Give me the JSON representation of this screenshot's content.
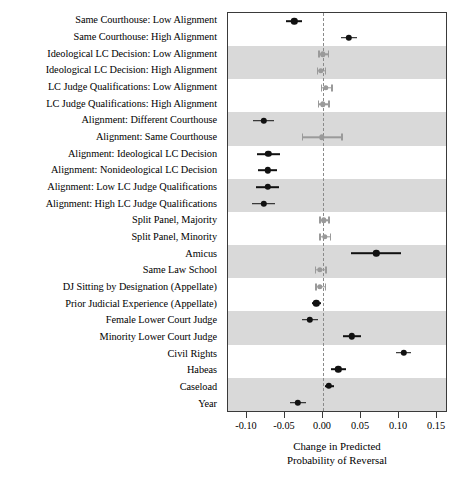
{
  "chart_data": {
    "type": "scatter",
    "title": "",
    "subtitle": "",
    "xlabel_line1": "Change in Predicted",
    "xlabel_line2": "Probability of Reversal",
    "ylabel": "",
    "xlim": [
      -0.125,
      0.1644
    ],
    "xticks": [
      -0.1,
      -0.05,
      0.0,
      0.05,
      0.1,
      0.15
    ],
    "xticklabels": [
      "-0.10",
      "-0.05",
      "0.00",
      "0.05",
      "0.10",
      "0.15"
    ],
    "grid": false,
    "legend": false,
    "zero_reference_line": 0.0,
    "orientation": "horizontal",
    "marker": "circle-with-confidence-interval",
    "colors": {
      "significant": "#111111",
      "not_significant": "#9a9a9a",
      "band_shading": "#d9d9d9",
      "frame": "#3a3a3a",
      "zero_line": "#8a8a8a",
      "background": "#ffffff"
    },
    "categories": [
      "Same Courthouse: Low Alignment",
      "Same Courthouse: High Alignment",
      "Ideological LC Decision: Low Alignment",
      "Ideological LC Decision: High Alignment",
      "LC Judge Qualifications: Low Alignment",
      "LC Judge Qualifications: High Alignment",
      "Alignment: Different Courthouse",
      "Alignment: Same Courthouse",
      "Alignment: Ideological LC Decision",
      "Alignment: Nonideological LC Decision",
      "Alignment: Low LC Judge Qualifications",
      "Alignment: High LC Judge Qualifications",
      "Split Panel, Majority",
      "Split Panel, Minority",
      "Amicus",
      "Same Law School",
      "DJ Sitting by Designation (Appellate)",
      "Prior Judicial Experience (Appellate)",
      "Female Lower Court Judge",
      "Minority Lower Court Judge",
      "Civil Rights",
      "Habeas",
      "Caseload",
      "Year"
    ],
    "points": [
      {
        "label": "Same Courthouse: Low Alignment",
        "estimate": -0.038,
        "ci_low": -0.049,
        "ci_high": -0.027,
        "significant": true
      },
      {
        "label": "Same Courthouse: High Alignment",
        "estimate": 0.034,
        "ci_low": 0.023,
        "ci_high": 0.045,
        "significant": true
      },
      {
        "label": "Ideological LC Decision: Low Alignment",
        "estimate": 0.0,
        "ci_low": -0.006,
        "ci_high": 0.006,
        "significant": false
      },
      {
        "label": "Ideological LC Decision: High Alignment",
        "estimate": -0.003,
        "ci_low": -0.008,
        "ci_high": 0.002,
        "significant": false
      },
      {
        "label": "LC Judge Qualifications: Low Alignment",
        "estimate": 0.004,
        "ci_low": -0.003,
        "ci_high": 0.011,
        "significant": false
      },
      {
        "label": "LC Judge Qualifications: High Alignment",
        "estimate": 0.0,
        "ci_low": -0.007,
        "ci_high": 0.007,
        "significant": false
      },
      {
        "label": "Alignment: Different Courthouse",
        "estimate": -0.078,
        "ci_low": -0.092,
        "ci_high": -0.064,
        "significant": true
      },
      {
        "label": "Alignment: Same Courthouse",
        "estimate": -0.002,
        "ci_low": -0.028,
        "ci_high": 0.024,
        "significant": false
      },
      {
        "label": "Alignment: Ideological LC Decision",
        "estimate": -0.072,
        "ci_low": -0.087,
        "ci_high": -0.057,
        "significant": true
      },
      {
        "label": "Alignment: Nonideological LC Decision",
        "estimate": -0.073,
        "ci_low": -0.086,
        "ci_high": -0.06,
        "significant": true
      },
      {
        "label": "Alignment: Low LC Judge Qualifications",
        "estimate": -0.073,
        "ci_low": -0.088,
        "ci_high": -0.058,
        "significant": true
      },
      {
        "label": "Alignment: High LC Judge Qualifications",
        "estimate": -0.078,
        "ci_low": -0.093,
        "ci_high": -0.063,
        "significant": true
      },
      {
        "label": "Split Panel, Majority",
        "estimate": 0.001,
        "ci_low": -0.005,
        "ci_high": 0.007,
        "significant": false
      },
      {
        "label": "Split Panel, Minority",
        "estimate": 0.002,
        "ci_low": -0.005,
        "ci_high": 0.009,
        "significant": false
      },
      {
        "label": "Amicus",
        "estimate": 0.07,
        "ci_low": 0.037,
        "ci_high": 0.102,
        "significant": true
      },
      {
        "label": "Same Law School",
        "estimate": -0.004,
        "ci_low": -0.011,
        "ci_high": 0.003,
        "significant": false
      },
      {
        "label": "DJ Sitting by Designation (Appellate)",
        "estimate": -0.004,
        "ci_low": -0.01,
        "ci_high": 0.002,
        "significant": false
      },
      {
        "label": "Prior Judicial Experience (Appellate)",
        "estimate": -0.009,
        "ci_low": -0.015,
        "ci_high": -0.003,
        "significant": true
      },
      {
        "label": "Female Lower Court Judge",
        "estimate": -0.017,
        "ci_low": -0.027,
        "ci_high": -0.007,
        "significant": true
      },
      {
        "label": "Minority Lower Court Judge",
        "estimate": 0.038,
        "ci_low": 0.026,
        "ci_high": 0.05,
        "significant": true
      },
      {
        "label": "Civil Rights",
        "estimate": 0.106,
        "ci_low": 0.096,
        "ci_high": 0.116,
        "significant": true
      },
      {
        "label": "Habeas",
        "estimate": 0.02,
        "ci_low": 0.01,
        "ci_high": 0.03,
        "significant": true
      },
      {
        "label": "Caseload",
        "estimate": 0.008,
        "ci_low": 0.002,
        "ci_high": 0.014,
        "significant": true
      },
      {
        "label": "Year",
        "estimate": -0.033,
        "ci_low": -0.043,
        "ci_high": -0.023,
        "significant": true
      }
    ]
  }
}
